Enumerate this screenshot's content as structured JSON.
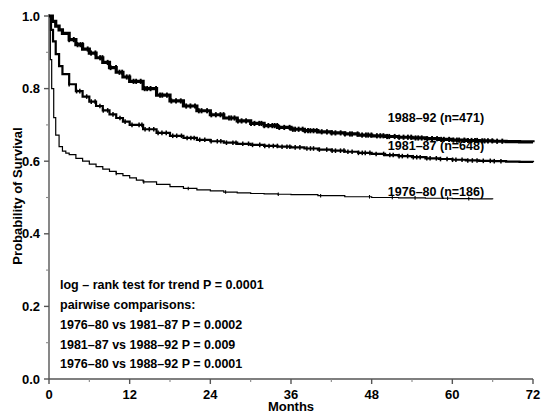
{
  "figure": {
    "background_color": "#ffffff",
    "foreground_color": "#000000"
  },
  "axes": {
    "x": {
      "label": "Months",
      "ticks": [
        "0",
        "12",
        "24",
        "36",
        "48",
        "60",
        "72"
      ],
      "tick_values": [
        0,
        12,
        24,
        36,
        48,
        60,
        72
      ],
      "range": [
        0,
        72
      ]
    },
    "y": {
      "label": "Probability of Survival",
      "ticks": [
        "0.0",
        "0.2",
        "0.4",
        "0.6",
        "0.8",
        "1.0"
      ],
      "tick_values": [
        0.0,
        0.2,
        0.4,
        0.6,
        0.8,
        1.0
      ],
      "range": [
        0.0,
        1.0
      ]
    }
  },
  "curve_labels": [
    {
      "id": "c1988",
      "text": "1988–92 (n=471)"
    },
    {
      "id": "c1981",
      "text": "1981–87 (n=648)"
    },
    {
      "id": "c1976",
      "text": "1976–80 (n=186)"
    }
  ],
  "statistics": {
    "lines": [
      "log – rank test for trend P = 0.0001",
      "pairwise comparisons:",
      "1976–80 vs 1981–87 P = 0.0002",
      "1981–87 vs 1988–92 P = 0.009",
      "1976–80 vs 1988–92 P = 0.0001"
    ]
  },
  "chart_data": {
    "type": "line",
    "title": "",
    "xlabel": "Months",
    "ylabel": "Probability of Survival",
    "xlim": [
      0,
      72
    ],
    "ylim": [
      0.0,
      1.0
    ],
    "grid": false,
    "legend_position": "inline-right",
    "style": "kaplan-meier-step",
    "series": [
      {
        "name": "1988–92 (n=471)",
        "n": 471,
        "line_width_px": 3.2,
        "label_text": "1988–92 (n=471)",
        "x": [
          0,
          0.5,
          1,
          1.5,
          2,
          3,
          4,
          5,
          6,
          7,
          8,
          9,
          10,
          11,
          12,
          14,
          16,
          18,
          20,
          22,
          24,
          26,
          28,
          30,
          32,
          34,
          36,
          38,
          40,
          42,
          44,
          46,
          48,
          50,
          52,
          54,
          56,
          58,
          60,
          62,
          64,
          66,
          68,
          70,
          72
        ],
        "y": [
          1.0,
          0.985,
          0.972,
          0.962,
          0.952,
          0.935,
          0.921,
          0.909,
          0.898,
          0.885,
          0.872,
          0.858,
          0.845,
          0.832,
          0.82,
          0.8,
          0.782,
          0.766,
          0.752,
          0.739,
          0.728,
          0.719,
          0.711,
          0.704,
          0.698,
          0.693,
          0.688,
          0.684,
          0.681,
          0.678,
          0.675,
          0.672,
          0.67,
          0.668,
          0.666,
          0.664,
          0.662,
          0.66,
          0.658,
          0.657,
          0.656,
          0.655,
          0.654,
          0.653,
          0.652
        ]
      },
      {
        "name": "1981–87 (n=648)",
        "n": 648,
        "line_width_px": 2.2,
        "label_text": "1981–87 (n=648)",
        "x": [
          0,
          0.3,
          0.6,
          1,
          1.5,
          2,
          3,
          4,
          5,
          6,
          7,
          8,
          9,
          10,
          11,
          12,
          14,
          16,
          18,
          20,
          22,
          24,
          26,
          28,
          30,
          32,
          34,
          36,
          38,
          40,
          42,
          44,
          46,
          48,
          50,
          52,
          54,
          56,
          58,
          60,
          62,
          64,
          66,
          68,
          70,
          72
        ],
        "y": [
          1.0,
          0.962,
          0.93,
          0.895,
          0.862,
          0.84,
          0.812,
          0.793,
          0.778,
          0.764,
          0.752,
          0.74,
          0.729,
          0.719,
          0.709,
          0.7,
          0.688,
          0.678,
          0.67,
          0.664,
          0.659,
          0.655,
          0.651,
          0.648,
          0.645,
          0.642,
          0.64,
          0.638,
          0.635,
          0.632,
          0.629,
          0.626,
          0.623,
          0.62,
          0.617,
          0.614,
          0.611,
          0.608,
          0.606,
          0.604,
          0.602,
          0.601,
          0.6,
          0.599,
          0.598,
          0.597
        ]
      },
      {
        "name": "1976–80 (n=186)",
        "n": 186,
        "line_width_px": 1.2,
        "label_text": "1976–80 (n=186)",
        "x": [
          0,
          0.2,
          0.4,
          0.7,
          1,
          1.5,
          2,
          2.5,
          3,
          4,
          5,
          6,
          7,
          8,
          9,
          10,
          11,
          12,
          13,
          14,
          16,
          18,
          20,
          22,
          24,
          26,
          28,
          30,
          32,
          34,
          36,
          40,
          44,
          48,
          52,
          56,
          60,
          63,
          66
        ],
        "y": [
          1.0,
          0.88,
          0.8,
          0.72,
          0.672,
          0.64,
          0.628,
          0.622,
          0.618,
          0.608,
          0.6,
          0.592,
          0.585,
          0.578,
          0.572,
          0.566,
          0.56,
          0.554,
          0.548,
          0.543,
          0.536,
          0.53,
          0.525,
          0.521,
          0.518,
          0.515,
          0.513,
          0.511,
          0.51,
          0.509,
          0.508,
          0.505,
          0.502,
          0.5,
          0.499,
          0.498,
          0.497,
          0.496,
          0.495
        ]
      }
    ]
  }
}
